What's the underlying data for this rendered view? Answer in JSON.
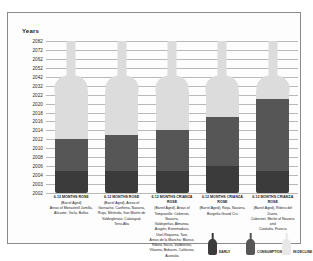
{
  "axis_title": "Years",
  "legend": {
    "items": [
      {
        "label": "EARLY",
        "icon": "wine-bottle-icon",
        "color": "#3b3b3b"
      },
      {
        "label": "CONSUMPTION",
        "icon": "wine-bottle-icon",
        "color": "#565656"
      },
      {
        "label": "IN DECLINE",
        "icon": "wine-bottle-icon",
        "color": "#e8e8e8"
      }
    ]
  },
  "chart_data": {
    "type": "bar",
    "title": "",
    "xlabel": "",
    "ylabel": "Years",
    "grid": true,
    "legend_position": "bottom-right",
    "y_ticks": [
      2002,
      2003,
      2004,
      2006,
      2008,
      2010,
      2012,
      2014,
      2016,
      2018,
      2020,
      2022,
      2032,
      2042,
      2052,
      2062,
      2072,
      2082
    ],
    "ylim": [
      2002,
      2082
    ],
    "zones": [
      "early",
      "consumption",
      "in_decline"
    ],
    "categories": [
      "6-12 MONTHS ROSE",
      "6-12 MONTHS ROSE",
      "6-12 MONTHS CRIANZA ROSE",
      "6-12 MONTHS CRIANZA ROSE",
      "6-12 MONTHS CRIANZA ROSE"
    ],
    "series": [
      {
        "name": "early_end",
        "values": [
          2005,
          2005,
          2005,
          2006,
          2005
        ]
      },
      {
        "name": "consumption_end",
        "values": [
          2012,
          2013,
          2014,
          2017,
          2021
        ]
      },
      {
        "name": "decline_end",
        "values": [
          2082,
          2082,
          2082,
          2082,
          2082
        ]
      }
    ],
    "bars": [
      {
        "heading": "6-12 MONTHS ROSE",
        "lines": [
          "(Barrel Aged)",
          "Areas of Monastrell Jumilla,",
          "Alicante, Yecla, Bullas"
        ],
        "early_end": 2005,
        "consumption_end": 2012
      },
      {
        "heading": "6-12 MONTHS ROSE",
        "lines": [
          "(Barrel Aged), Areas of",
          "Garnacha: Cariñena, Navarra,",
          "Rioja, Méntrida, San Martín de",
          "Valdeiglesias, Calatayud,",
          "Terra Alta"
        ],
        "early_end": 2005,
        "consumption_end": 2013
      },
      {
        "heading": "6-12 MONTHS CRIANZA ROSE",
        "lines": [
          "(Barrel Aged), Areas of",
          "Tempranillo: Cebreros, Navarra,",
          "Valdepeñas, Almansa,",
          "Aragón, Extremadura,",
          "Utiel-Requena, Toro,",
          "Areas de la Mancha: Blanco,",
          "Ribera Sacra, Valdeorras,",
          "Vilaonia, Bobares, California,",
          "Australia"
        ],
        "early_end": 2005,
        "consumption_end": 2014
      },
      {
        "heading": "6-12 MONTHS CRIANZA ROSE",
        "lines": [
          "(Barrel Aged), Rioja, Navarra,",
          "Borgoña Grand Cru"
        ],
        "early_end": 2006,
        "consumption_end": 2017
      },
      {
        "heading": "6-12 MONTHS CRIANZA ROSE",
        "lines": [
          "(Barrel Aged), Ribera del Duero,",
          "Cabernet, Merlot of Navarra and",
          "Cataluña, Francia"
        ],
        "early_end": 2005,
        "consumption_end": 2021
      }
    ]
  }
}
